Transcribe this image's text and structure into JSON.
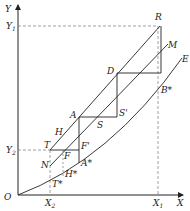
{
  "diagram": {
    "axes": {
      "y_label": "Y",
      "x_label": "X",
      "origin_label": "O",
      "y_ticks": [
        {
          "label": "Y",
          "sub": "1"
        },
        {
          "label": "Y",
          "sub": "2"
        }
      ],
      "x_ticks": [
        {
          "label": "X",
          "sub": "2"
        },
        {
          "label": "X",
          "sub": "1"
        }
      ]
    },
    "points": {
      "R": "R",
      "M": "M",
      "E": "E",
      "D": "D",
      "B_star": "B*",
      "A": "A",
      "S": "S",
      "S_prime": "S'",
      "H": "H",
      "T": "T",
      "F": "F",
      "F_prime": "F'",
      "N": "N",
      "A_star": "A*",
      "H_star": "H*",
      "T_star": "T*"
    },
    "colors": {
      "line": "#222222",
      "dashed": "#888888",
      "background": "#ffffff"
    }
  }
}
